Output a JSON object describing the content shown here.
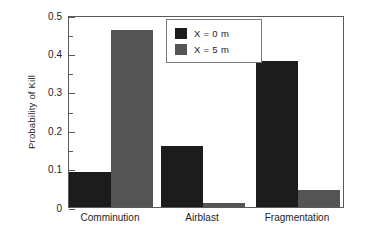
{
  "chart_data": {
    "type": "bar",
    "title": "",
    "xlabel": "",
    "ylabel": "Probability of Kill",
    "categories": [
      "Comminution",
      "Airblast",
      "Fragmentation"
    ],
    "series": [
      {
        "name": "X = 0 m",
        "color": "#1c1c1c",
        "values": [
          0.09,
          0.16,
          0.38
        ]
      },
      {
        "name": "X = 5 m",
        "color": "#555555",
        "values": [
          0.46,
          0.01,
          0.045
        ]
      }
    ],
    "ylim": [
      0,
      0.5
    ],
    "ytick_labels": [
      "0",
      "0.1",
      "0.2",
      "0.3",
      "0.4",
      "0.5"
    ],
    "ytick_values": [
      0,
      0.1,
      0.2,
      0.3,
      0.4,
      0.5
    ],
    "yminor_values": [
      0.05,
      0.15,
      0.25,
      0.35,
      0.45
    ],
    "grid": false,
    "legend_position": "top-center",
    "frame_color": "#5a5a5a",
    "background": "#ffffff"
  }
}
